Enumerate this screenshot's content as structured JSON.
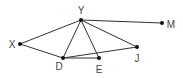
{
  "diagram": {
    "type": "graph",
    "nodes": [
      {
        "id": "Y",
        "label": "Y",
        "x": 81,
        "y": 20,
        "lx": 81,
        "ly": 14
      },
      {
        "id": "X",
        "label": "X",
        "x": 20,
        "y": 44,
        "lx": 12,
        "ly": 48
      },
      {
        "id": "D",
        "label": "D",
        "x": 63,
        "y": 58,
        "lx": 59,
        "ly": 70
      },
      {
        "id": "E",
        "label": "E",
        "x": 99,
        "y": 58,
        "lx": 99,
        "ly": 73
      },
      {
        "id": "J",
        "label": "J",
        "x": 137,
        "y": 47,
        "lx": 137,
        "ly": 62
      },
      {
        "id": "M",
        "label": "M",
        "x": 162,
        "y": 23,
        "lx": 171,
        "ly": 28
      }
    ],
    "edges": [
      [
        "Y",
        "X"
      ],
      [
        "Y",
        "M"
      ],
      [
        "Y",
        "D"
      ],
      [
        "Y",
        "E"
      ],
      [
        "Y",
        "J"
      ],
      [
        "X",
        "D"
      ],
      [
        "D",
        "E"
      ],
      [
        "D",
        "J"
      ]
    ],
    "colors": {
      "edge": "#333333",
      "node": "#111111",
      "label": "#444444"
    }
  }
}
